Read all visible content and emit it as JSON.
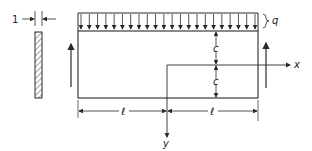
{
  "diagram": {
    "labels": {
      "thickness": "1",
      "load": "q",
      "half_depth_top": "c",
      "half_depth_bottom": "c",
      "x_axis": "x",
      "y_axis": "y",
      "half_span_left": "ℓ",
      "half_span_right": "ℓ"
    },
    "load_arrow_count": 22,
    "colors": {
      "line": "#2a2a2a",
      "background": "#ffffff"
    }
  }
}
